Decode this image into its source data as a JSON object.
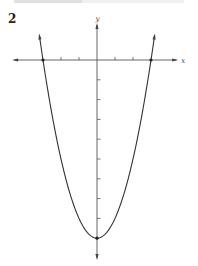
{
  "problem_number": "2",
  "chart_data": {
    "type": "line",
    "title": "",
    "function": "y = x^2 - 9",
    "xlabel": "x",
    "ylabel": "y",
    "xlim": [
      -4.6,
      4.4
    ],
    "ylim": [
      -10,
      2
    ],
    "x_ticks": [
      -2,
      -1,
      1,
      2
    ],
    "y_ticks": [
      -1,
      -2,
      -3,
      -4,
      -5,
      -6,
      -7,
      -8
    ],
    "tick_labels_shown": false,
    "grid": false,
    "legend": "none",
    "series": [
      {
        "name": "parabola",
        "x": [
          -3.2,
          -3,
          -2,
          -1,
          0,
          1,
          2,
          3,
          3.2
        ],
        "y": [
          1.24,
          0,
          -5,
          -8,
          -9,
          -8,
          -5,
          0,
          1.24
        ]
      }
    ],
    "marked_points": [
      {
        "label": "x-intercept-left",
        "x": -3,
        "y": 0
      },
      {
        "label": "x-intercept-right",
        "x": 3,
        "y": 0
      },
      {
        "label": "vertex",
        "x": 0,
        "y": -9
      }
    ]
  }
}
